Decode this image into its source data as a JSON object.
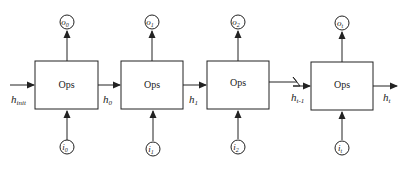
{
  "diagram": {
    "type": "rnn-unrolled-cells",
    "cells": [
      {
        "op": "Ops",
        "input": "i",
        "input_sub": "0",
        "output": "o",
        "output_sub": "0",
        "x": 35
      },
      {
        "op": "Ops",
        "input": "i",
        "input_sub": "1",
        "output": "o",
        "output_sub": "1",
        "x": 121
      },
      {
        "op": "Ops",
        "input": "i",
        "input_sub": "2",
        "output": "o",
        "output_sub": "2",
        "x": 207
      },
      {
        "op": "Ops",
        "input": "i",
        "input_sub": "t",
        "output": "o",
        "output_sub": "t",
        "x": 311
      }
    ],
    "hidden_states": [
      {
        "label": "h",
        "sub": "init"
      },
      {
        "label": "h",
        "sub": "0"
      },
      {
        "label": "h",
        "sub": "1"
      },
      {
        "label": "h",
        "sub": "t-1"
      },
      {
        "label": "h",
        "sub": "t"
      }
    ],
    "colors": {
      "stroke": "#222222",
      "background": "#ffffff"
    }
  }
}
